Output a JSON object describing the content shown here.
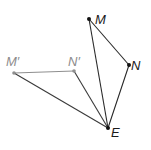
{
  "diagram": {
    "title": "",
    "points": [
      {
        "id": "M",
        "label": "M",
        "style": "dark"
      },
      {
        "id": "N",
        "label": "N",
        "style": "dark"
      },
      {
        "id": "E",
        "label": "E",
        "style": "dark"
      },
      {
        "id": "Mp",
        "label": "M′",
        "style": "gray"
      },
      {
        "id": "Np",
        "label": "N′",
        "style": "gray"
      }
    ],
    "segments": [
      {
        "from": "M",
        "to": "N",
        "style": "dark"
      },
      {
        "from": "M",
        "to": "E",
        "style": "dark"
      },
      {
        "from": "N",
        "to": "E",
        "style": "dark"
      },
      {
        "from": "Mp",
        "to": "Np",
        "style": "gray"
      },
      {
        "from": "Mp",
        "to": "E",
        "style": "dark"
      },
      {
        "from": "Np",
        "to": "E",
        "style": "dark"
      }
    ],
    "colors": {
      "original": "#111111",
      "image": "#8f8f8f"
    }
  }
}
